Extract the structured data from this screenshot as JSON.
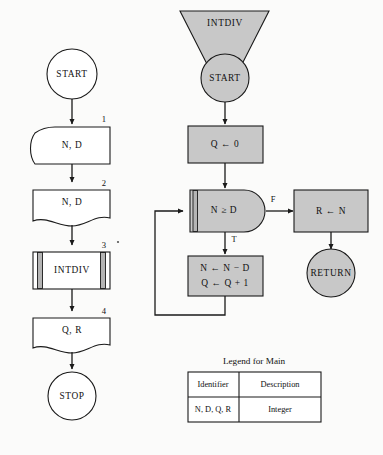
{
  "diagram": {
    "colors": {
      "gray_fill": "#c8c8c8",
      "bar_gray": "#b4b4b4",
      "white_fill": "#ffffff",
      "stroke": "#1a1a1a",
      "page_bg": "#fbfbfa"
    }
  },
  "main_module": {
    "start_label": "START",
    "stop_label": "STOP",
    "steps": [
      {
        "number": "1",
        "label": "N, D",
        "shape": "display"
      },
      {
        "number": "2",
        "label": "N, D",
        "shape": "document"
      },
      {
        "number": "3",
        "label": "INTDIV",
        "shape": "predefined-process"
      },
      {
        "number": "4",
        "label": "Q, R",
        "shape": "document"
      }
    ]
  },
  "intdiv_module": {
    "header_label": "INTDIV",
    "start_label": "START",
    "return_label": "RETURN",
    "init_label": "Q ← 0",
    "decision_label": "N ≥ D",
    "branch_true_label": "T",
    "branch_false_label": "F",
    "loop_body_line1": "N ← N − D",
    "loop_body_line2": "Q ← Q + 1",
    "false_action_label": "R ← N"
  },
  "legend": {
    "title": "Legend for Main",
    "headers": [
      "Identifier",
      "Description"
    ],
    "rows": [
      {
        "identifier": "N, D, Q, R",
        "description": "Integer"
      }
    ]
  }
}
